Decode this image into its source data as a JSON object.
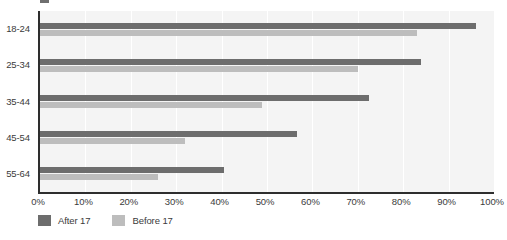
{
  "chart_data": {
    "type": "bar",
    "orientation": "horizontal",
    "title": "",
    "subtitle": "",
    "xlabel": "",
    "ylabel": "",
    "categories": [
      "18-24",
      "25-34",
      "35-44",
      "45-54",
      "55-64"
    ],
    "series": [
      {
        "name": "After 17",
        "color": "#6d6d6d",
        "values": [
          96,
          84,
          72.5,
          56.5,
          40.5
        ]
      },
      {
        "name": "Before 17",
        "color": "#bdbdbd",
        "values": [
          83,
          70,
          49,
          32,
          26
        ]
      }
    ],
    "xlim": [
      0,
      100
    ],
    "x_ticks": [
      0,
      10,
      20,
      30,
      40,
      50,
      60,
      70,
      80,
      90,
      100
    ],
    "x_tick_labels": [
      "0%",
      "10%",
      "20%",
      "30%",
      "40%",
      "50%",
      "60%",
      "70%",
      "80%",
      "90%",
      "100%"
    ],
    "value_unit": "%",
    "grid": true,
    "grid_axis": "x",
    "grid_color": "#ffffff",
    "plot_background": "#f4f4f4",
    "axis_color": "#2e2e2e",
    "legend_position": "bottom-left",
    "annotations": []
  },
  "legend": {
    "items": [
      {
        "label": "After 17",
        "swatch_name": "legend-swatch-after-17",
        "color": "#6d6d6d"
      },
      {
        "label": "Before 17",
        "swatch_name": "legend-swatch-before-17",
        "color": "#bdbdbd"
      }
    ]
  }
}
